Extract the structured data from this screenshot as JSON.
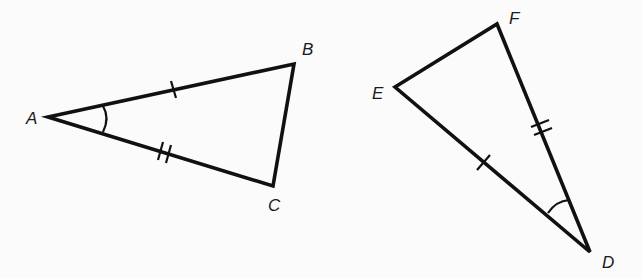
{
  "diagram": {
    "type": "congruent-triangles",
    "background": "#fbfbfb",
    "stroke_color": "#111111",
    "triangles": [
      {
        "name": "ABC",
        "vertices": {
          "A": {
            "label": "A",
            "x": 48,
            "y": 117,
            "label_x": 26,
            "label_y": 124
          },
          "B": {
            "label": "B",
            "x": 294,
            "y": 64,
            "label_x": 302,
            "label_y": 55
          },
          "C": {
            "label": "C",
            "x": 273,
            "y": 186,
            "label_x": 268,
            "label_y": 211
          }
        },
        "marks": {
          "AB": "single-tick",
          "AC": "double-tick",
          "angle_A": "single-arc"
        }
      },
      {
        "name": "DEF",
        "vertices": {
          "E": {
            "label": "E",
            "x": 395,
            "y": 87,
            "label_x": 372,
            "label_y": 99
          },
          "F": {
            "label": "F",
            "x": 497,
            "y": 24,
            "label_x": 509,
            "label_y": 24
          },
          "D": {
            "label": "D",
            "x": 590,
            "y": 252,
            "label_x": 602,
            "label_y": 268
          }
        },
        "marks": {
          "ED": "single-tick",
          "FD": "double-tick",
          "angle_D": "single-arc"
        }
      }
    ]
  }
}
